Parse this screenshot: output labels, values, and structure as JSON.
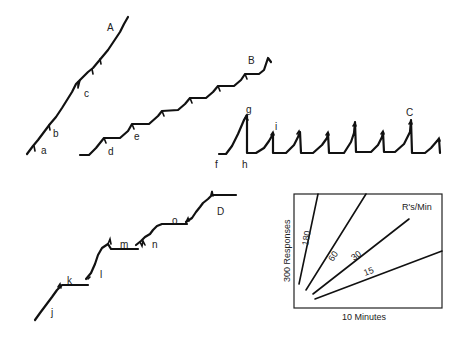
{
  "figure": {
    "records": {
      "A": {
        "label": "A",
        "markers": [
          "a",
          "b",
          "c"
        ]
      },
      "B": {
        "label": "B",
        "markers": [
          "d",
          "e"
        ]
      },
      "C": {
        "label": "C",
        "markers": [
          "f",
          "g",
          "h",
          "i"
        ]
      },
      "D": {
        "label": "D",
        "markers": [
          "j",
          "k",
          "l",
          "m",
          "n",
          "o"
        ]
      }
    },
    "labels": {
      "A": "A",
      "B": "B",
      "C": "C",
      "D": "D",
      "a": "a",
      "b": "b",
      "c": "c",
      "d": "d",
      "e": "e",
      "f": "f",
      "g": "g",
      "h": "h",
      "i": "i",
      "j": "j",
      "k": "k",
      "l": "l",
      "m": "m",
      "n": "n",
      "o": "o"
    },
    "key": {
      "title": "R's/Min",
      "y_axis_label": "300 Responses",
      "x_axis_label": "10 Minutes",
      "rates": [
        "180",
        "60",
        "30",
        "15"
      ]
    }
  }
}
